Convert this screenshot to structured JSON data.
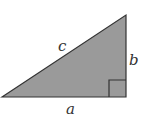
{
  "diagram": {
    "type": "right-triangle",
    "labels": {
      "hypotenuse": "c",
      "vertical_leg": "b",
      "horizontal_leg": "a"
    },
    "colors": {
      "fill": "#9a9a9a",
      "stroke": "#333333",
      "background": "#ffffff"
    },
    "right_angle_marker": true
  }
}
